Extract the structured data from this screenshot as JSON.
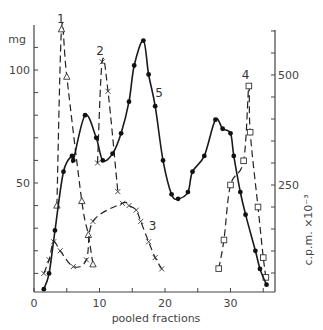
{
  "chart_data": {
    "type": "line",
    "title": "",
    "xlabel": "pooled fractions",
    "ylabel_left": "mg",
    "ylabel_right": "c.p.m. ×10⁻³",
    "xlim": [
      0,
      37
    ],
    "ylim_left": [
      0,
      120
    ],
    "ylim_right": [
      0,
      600
    ],
    "x_ticks": [
      0,
      10,
      20,
      30
    ],
    "x_minor_ticks": [
      5,
      15,
      25,
      35
    ],
    "y_left_ticks": [
      50,
      100
    ],
    "y_right_ticks": [
      250,
      500
    ],
    "grid": false,
    "legend": "inline numeric labels on curves",
    "series": [
      {
        "name": "1",
        "axis": "left",
        "style": "dashed",
        "marker": "triangle-open",
        "points": [
          [
            3.5,
            40
          ],
          [
            4.2,
            118
          ],
          [
            5.0,
            97
          ],
          [
            7.3,
            42
          ],
          [
            8.3,
            27
          ],
          [
            9.0,
            14
          ]
        ],
        "label_pos": [
          4.1,
          121
        ]
      },
      {
        "name": "2",
        "axis": "right",
        "style": "dashed",
        "marker": "x",
        "points": [
          [
            9.7,
            300
          ],
          [
            10.4,
            530
          ],
          [
            11.3,
            463
          ],
          [
            12.8,
            235
          ]
        ],
        "label_pos": [
          10.1,
          545
        ]
      },
      {
        "name": "3",
        "axis": "left",
        "style": "dashed",
        "marker": "x",
        "points": [
          [
            1.5,
            10
          ],
          [
            2.3,
            16
          ],
          [
            3.0,
            24
          ],
          [
            4.0,
            20
          ],
          [
            6.0,
            13
          ],
          [
            8.0,
            16
          ],
          [
            9.0,
            33
          ],
          [
            13.5,
            41
          ],
          [
            14.5,
            40
          ],
          [
            15.6,
            38
          ],
          [
            16.3,
            33
          ],
          [
            17.5,
            24
          ],
          [
            18.5,
            17
          ],
          [
            19.5,
            12
          ]
        ],
        "label_pos": [
          18.1,
          29
        ]
      },
      {
        "name": "4",
        "axis": "right",
        "style": "dashed",
        "marker": "square-open",
        "points": [
          [
            28.2,
            60
          ],
          [
            29.0,
            125
          ],
          [
            30.0,
            250
          ],
          [
            32.0,
            305
          ],
          [
            32.8,
            475
          ],
          [
            33.0,
            370
          ],
          [
            34.2,
            200
          ],
          [
            35.0,
            85
          ],
          [
            35.4,
            40
          ]
        ],
        "label_pos": [
          32.3,
          490
        ]
      },
      {
        "name": "5",
        "axis": "left",
        "style": "solid",
        "marker": "dot",
        "points": [
          [
            1.5,
            3
          ],
          [
            2.3,
            10
          ],
          [
            3.2,
            29
          ],
          [
            4.5,
            55
          ],
          [
            5.8,
            62
          ],
          [
            6.0,
            60
          ],
          [
            7.8,
            80
          ],
          [
            9.5,
            70
          ],
          [
            10.5,
            60
          ],
          [
            12.0,
            63
          ],
          [
            13.3,
            72
          ],
          [
            14.5,
            86
          ],
          [
            15.3,
            102
          ],
          [
            16.7,
            113
          ],
          [
            17.5,
            98
          ],
          [
            18.5,
            84
          ],
          [
            19.7,
            60
          ],
          [
            21.0,
            45
          ],
          [
            22.0,
            43
          ],
          [
            23.5,
            46
          ],
          [
            24.2,
            55
          ],
          [
            26.0,
            62
          ],
          [
            27.7,
            78
          ],
          [
            28.8,
            74
          ],
          [
            30.0,
            72
          ],
          [
            30.5,
            62
          ],
          [
            31.5,
            46
          ],
          [
            32.3,
            36
          ],
          [
            33.8,
            20
          ],
          [
            34.5,
            12
          ],
          [
            35.5,
            5
          ]
        ],
        "label_pos": [
          19.1,
          88
        ]
      }
    ]
  }
}
